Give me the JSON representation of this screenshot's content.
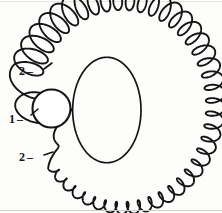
{
  "figure": {
    "background_color": "#fdfdfc",
    "ink_color": "#141414"
  },
  "labels": [
    {
      "id": "label-2-top",
      "text": "2",
      "leader": "–",
      "target": "outer-looping-curve-upper-attachment",
      "x": 19,
      "y": 64
    },
    {
      "id": "label-1-mid",
      "text": "1",
      "leader": "–",
      "target": "central-circle",
      "x": 9,
      "y": 112
    },
    {
      "id": "label-2-bot",
      "text": "2",
      "leader": "–",
      "target": "outer-looping-curve-lower-attachment",
      "x": 19,
      "y": 150
    }
  ],
  "geometry": {
    "central_circle": {
      "name": "central-circle",
      "cx": 51.5,
      "cy": 108.5,
      "r": 19.0,
      "stroke_width": 2.1
    },
    "inner_curve": {
      "name": "inner-smooth-orbit",
      "note": "Large smooth closed cardioid-like loop anchored at the left circle, extending right to x=140.",
      "stroke_width": 1.7,
      "extent": {
        "left": 50,
        "right": 141,
        "top": 48,
        "bottom": 172
      }
    },
    "outer_curve": {
      "name": "outer-looping-orbit",
      "note": "Epicyclic curve traced around a guide ellipse; loop amplitude grows clockwise from the attachment points.",
      "stroke_width": 1.9,
      "guide_ellipse": {
        "cx": 122,
        "cy": 106,
        "rx": 84,
        "ry": 96
      },
      "loop_count": 46,
      "loop_amplitude_min": 3.0,
      "loop_amplitude_max": 15.0,
      "extent": {
        "left": 52,
        "right": 213,
        "top": 6,
        "bottom": 208
      }
    }
  },
  "artifacts": {
    "scan_line_bottom_color": "#cfcfcb",
    "scan_line_top_color": "#e4e4e0"
  }
}
